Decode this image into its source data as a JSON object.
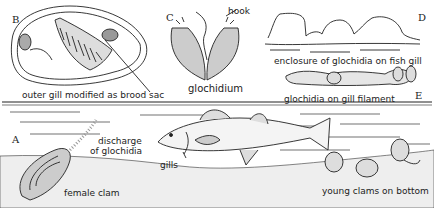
{
  "figure": {
    "panels": {
      "A": {
        "letter": "A",
        "labels": {
          "discharge": "discharge",
          "discharge2": "of glochidia",
          "gills": "gills",
          "female_clam": "female clam",
          "young_clams": "young clams on bottom"
        }
      },
      "B": {
        "letter": "B",
        "label": "outer gill modified as brood sac"
      },
      "C": {
        "letter": "C",
        "label": "glochidium",
        "hook_label": "hook"
      },
      "D": {
        "letter": "D",
        "label": "enclosure of glochidia on fish gill"
      },
      "E": {
        "letter": "E",
        "label": "glochidia on gill filament"
      }
    },
    "colors": {
      "ink": "#222222",
      "background": "#ffffff",
      "stipple": "#888888"
    }
  }
}
